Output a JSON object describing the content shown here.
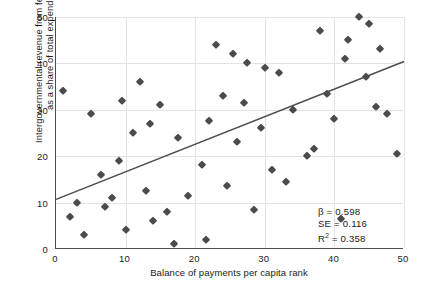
{
  "chart_data": {
    "type": "scatter",
    "title": "",
    "xlabel": "Balance of payments per capita rank",
    "ylabel": "Intergovernmental revenue from federal government as a share of total expenditures rank",
    "xlim": [
      0,
      50
    ],
    "ylim": [
      0,
      50
    ],
    "xticks": [
      0,
      10,
      20,
      30,
      40,
      50
    ],
    "yticks": [
      0,
      10,
      20,
      30,
      40,
      50
    ],
    "grid": true,
    "legend": "none",
    "marker": "diamond",
    "marker_color": "#4a4a4f",
    "line_color": "#4c4c4c",
    "points": [
      {
        "x": 1.0,
        "y": 34.0
      },
      {
        "x": 2.0,
        "y": 7.0
      },
      {
        "x": 3.0,
        "y": 10.0
      },
      {
        "x": 4.0,
        "y": 3.0
      },
      {
        "x": 5.0,
        "y": 29.0
      },
      {
        "x": 6.5,
        "y": 16.0
      },
      {
        "x": 7.0,
        "y": 9.0
      },
      {
        "x": 8.0,
        "y": 11.0
      },
      {
        "x": 9.0,
        "y": 19.0
      },
      {
        "x": 9.5,
        "y": 32.0
      },
      {
        "x": 10.0,
        "y": 4.0
      },
      {
        "x": 11.0,
        "y": 25.0
      },
      {
        "x": 12.0,
        "y": 36.0
      },
      {
        "x": 13.0,
        "y": 12.5
      },
      {
        "x": 13.5,
        "y": 27.0
      },
      {
        "x": 14.0,
        "y": 6.0
      },
      {
        "x": 15.0,
        "y": 31.0
      },
      {
        "x": 16.0,
        "y": 8.0
      },
      {
        "x": 17.0,
        "y": 1.0
      },
      {
        "x": 17.5,
        "y": 24.0
      },
      {
        "x": 19.0,
        "y": 11.5
      },
      {
        "x": 21.0,
        "y": 18.0
      },
      {
        "x": 21.5,
        "y": 2.0
      },
      {
        "x": 22.0,
        "y": 27.5
      },
      {
        "x": 23.0,
        "y": 44.0
      },
      {
        "x": 24.0,
        "y": 33.0
      },
      {
        "x": 24.5,
        "y": 13.5
      },
      {
        "x": 25.5,
        "y": 42.0
      },
      {
        "x": 26.0,
        "y": 23.0
      },
      {
        "x": 27.0,
        "y": 31.5
      },
      {
        "x": 27.5,
        "y": 40.0
      },
      {
        "x": 28.5,
        "y": 8.5
      },
      {
        "x": 29.5,
        "y": 26.0
      },
      {
        "x": 30.0,
        "y": 39.0
      },
      {
        "x": 31.0,
        "y": 17.0
      },
      {
        "x": 32.0,
        "y": 38.0
      },
      {
        "x": 33.0,
        "y": 14.5
      },
      {
        "x": 34.0,
        "y": 30.0
      },
      {
        "x": 36.0,
        "y": 20.0
      },
      {
        "x": 37.0,
        "y": 21.5
      },
      {
        "x": 38.0,
        "y": 47.0
      },
      {
        "x": 39.0,
        "y": 33.5
      },
      {
        "x": 40.0,
        "y": 28.0
      },
      {
        "x": 41.0,
        "y": 6.5
      },
      {
        "x": 41.5,
        "y": 41.0
      },
      {
        "x": 42.0,
        "y": 45.0
      },
      {
        "x": 43.5,
        "y": 50.0
      },
      {
        "x": 44.5,
        "y": 37.0
      },
      {
        "x": 45.0,
        "y": 48.5
      },
      {
        "x": 46.0,
        "y": 30.5
      },
      {
        "x": 46.5,
        "y": 43.0
      },
      {
        "x": 47.5,
        "y": 29.0
      },
      {
        "x": 49.0,
        "y": 20.5
      }
    ],
    "trendline": {
      "x0": 0,
      "y0": 10.7,
      "x1": 50,
      "y1": 40.4
    },
    "annotations": {
      "beta_label": "β = 0.598",
      "se_label": "SE = 0.116",
      "r2_prefix": "R",
      "r2_exponent": "2",
      "r2_suffix": " = 0.358"
    }
  }
}
